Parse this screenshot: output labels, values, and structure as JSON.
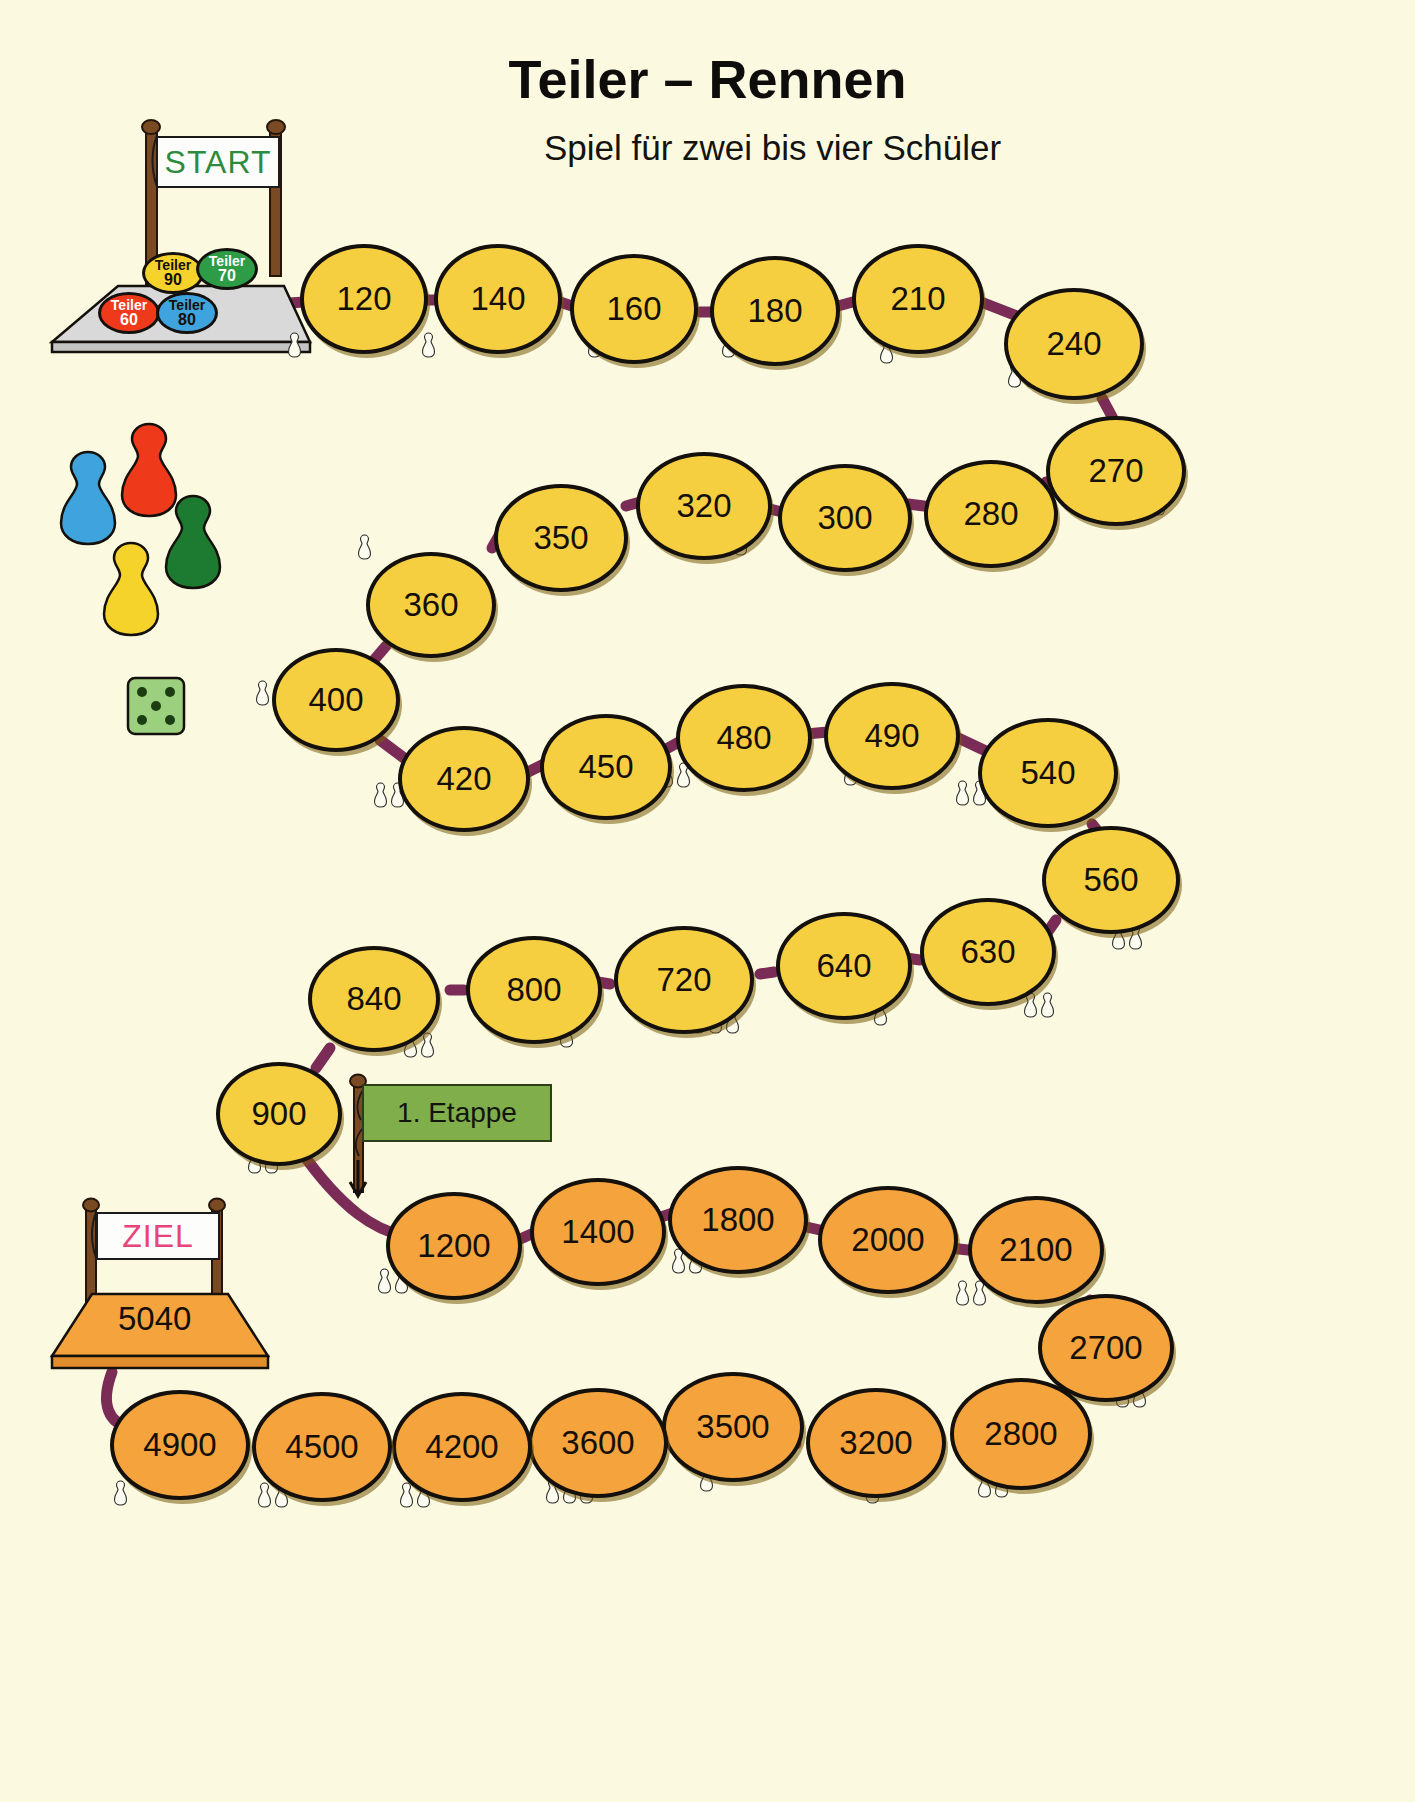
{
  "page": {
    "title": "Teiler – Rennen",
    "subtitle": "Spiel für zwei bis vier Schüler",
    "background_color": "#fbfae0"
  },
  "start_gate": {
    "banner_label": "START",
    "banner_text_color": "#2e8b3d",
    "platform_color": "#d9d9d9"
  },
  "finish_gate": {
    "banner_label": "ZIEL",
    "banner_text_color": "#e8447c",
    "platform_color": "#f5a33c",
    "final_value": "5040"
  },
  "divider_chips": [
    {
      "word": "Teiler",
      "number": "90",
      "color": "#f6d32a",
      "text_color": "#141008"
    },
    {
      "word": "Teiler",
      "number": "70",
      "color": "#2e9b46",
      "text_color": "#ffffff"
    },
    {
      "word": "Teiler",
      "number": "60",
      "color": "#ee3a1b",
      "text_color": "#ffffff"
    },
    {
      "word": "Teiler",
      "number": "80",
      "color": "#3fa3dd",
      "text_color": "#141008"
    }
  ],
  "pawns": [
    {
      "name": "pawn-blue",
      "color": "#3fa3dd"
    },
    {
      "name": "pawn-red",
      "color": "#ee3a1b"
    },
    {
      "name": "pawn-green",
      "color": "#1d7a31"
    },
    {
      "name": "pawn-yellow",
      "color": "#f6d32a"
    }
  ],
  "die": {
    "color": "#9ccf7e",
    "pips": 5,
    "pip_color": "#1c3d12"
  },
  "stage_flag": {
    "label": "1. Etappe",
    "cloth_color": "#7fae4b"
  },
  "colors": {
    "node_stage1": "#f6cf41",
    "node_stage2": "#f5a33c",
    "connector": "#7a2b56",
    "outline": "#14100c"
  },
  "board": {
    "rows": [
      {
        "row": 1,
        "color": "node_stage1",
        "nodes": [
          {
            "value": "120",
            "ticks": 1
          },
          {
            "value": "140",
            "ticks": 1
          },
          {
            "value": "160",
            "ticks": 1
          },
          {
            "value": "180",
            "ticks": 2
          },
          {
            "value": "210",
            "ticks": 1
          },
          {
            "value": "240",
            "ticks": 2
          },
          {
            "value": "270",
            "ticks": 1
          }
        ]
      },
      {
        "row": 2,
        "color": "node_stage1",
        "nodes": [
          {
            "value": "280",
            "ticks": 1
          },
          {
            "value": "300",
            "ticks": 1
          },
          {
            "value": "320",
            "ticks": 1
          },
          {
            "value": "350",
            "ticks": 1
          },
          {
            "value": "360",
            "ticks": 1
          },
          {
            "value": "400",
            "ticks": 1
          }
        ]
      },
      {
        "row": 3,
        "color": "node_stage1",
        "nodes": [
          {
            "value": "420",
            "ticks": 2
          },
          {
            "value": "450",
            "ticks": 1
          },
          {
            "value": "480",
            "ticks": 2
          },
          {
            "value": "490",
            "ticks": 1
          },
          {
            "value": "540",
            "ticks": 2
          },
          {
            "value": "560",
            "ticks": 2
          }
        ]
      },
      {
        "row": 4,
        "color": "node_stage1",
        "nodes": [
          {
            "value": "630",
            "ticks": 2
          },
          {
            "value": "640",
            "ticks": 1
          },
          {
            "value": "720",
            "ticks": 3
          },
          {
            "value": "800",
            "ticks": 1
          },
          {
            "value": "840",
            "ticks": 2
          },
          {
            "value": "900",
            "ticks": 2
          }
        ]
      },
      {
        "row": 5,
        "color": "node_stage2",
        "nodes": [
          {
            "value": "1200",
            "ticks": 2
          },
          {
            "value": "1400",
            "ticks": 1
          },
          {
            "value": "1800",
            "ticks": 2
          },
          {
            "value": "2000",
            "ticks": 1
          },
          {
            "value": "2100",
            "ticks": 2
          },
          {
            "value": "2700",
            "ticks": 2
          }
        ]
      },
      {
        "row": 6,
        "color": "node_stage2",
        "nodes": [
          {
            "value": "2800",
            "ticks": 2
          },
          {
            "value": "3200",
            "ticks": 1
          },
          {
            "value": "3500",
            "ticks": 1
          },
          {
            "value": "3600",
            "ticks": 3
          },
          {
            "value": "4200",
            "ticks": 2
          },
          {
            "value": "4500",
            "ticks": 2
          },
          {
            "value": "4900",
            "ticks": 1
          }
        ]
      }
    ]
  },
  "node_layout": [
    {
      "value": "120",
      "x": 300,
      "y": 244,
      "w": 128,
      "h": 110,
      "color": "y",
      "ticks": 1,
      "tx": 288,
      "ty": 332
    },
    {
      "value": "140",
      "x": 434,
      "y": 244,
      "w": 128,
      "h": 110,
      "color": "y",
      "ticks": 1,
      "tx": 422,
      "ty": 332
    },
    {
      "value": "160",
      "x": 570,
      "y": 254,
      "w": 128,
      "h": 110,
      "color": "y",
      "ticks": 1,
      "tx": 588,
      "ty": 332
    },
    {
      "value": "180",
      "x": 710,
      "y": 256,
      "w": 130,
      "h": 110,
      "color": "y",
      "ticks": 2,
      "tx": 722,
      "ty": 332
    },
    {
      "value": "210",
      "x": 852,
      "y": 244,
      "w": 132,
      "h": 110,
      "color": "y",
      "ticks": 1,
      "tx": 880,
      "ty": 338
    },
    {
      "value": "240",
      "x": 1004,
      "y": 288,
      "w": 140,
      "h": 112,
      "color": "y",
      "ticks": 2,
      "tx": 1008,
      "ty": 362
    },
    {
      "value": "270",
      "x": 1046,
      "y": 416,
      "w": 140,
      "h": 110,
      "color": "y",
      "ticks": 1,
      "tx": 1152,
      "ty": 490
    },
    {
      "value": "280",
      "x": 924,
      "y": 460,
      "w": 134,
      "h": 108,
      "color": "y",
      "ticks": 1,
      "tx": 1020,
      "ty": 532
    },
    {
      "value": "300",
      "x": 778,
      "y": 464,
      "w": 134,
      "h": 108,
      "color": "y",
      "ticks": 1,
      "tx": 876,
      "ty": 534
    },
    {
      "value": "320",
      "x": 636,
      "y": 452,
      "w": 136,
      "h": 108,
      "color": "y",
      "ticks": 1,
      "tx": 734,
      "ty": 530
    },
    {
      "value": "350",
      "x": 494,
      "y": 484,
      "w": 134,
      "h": 108,
      "color": "y",
      "ticks": 1,
      "tx": 596,
      "ty": 542
    },
    {
      "value": "360",
      "x": 366,
      "y": 552,
      "w": 130,
      "h": 106,
      "color": "y",
      "ticks": 1,
      "tx": 358,
      "ty": 534
    },
    {
      "value": "400",
      "x": 272,
      "y": 648,
      "w": 128,
      "h": 104,
      "color": "y",
      "ticks": 1,
      "tx": 256,
      "ty": 680
    },
    {
      "value": "420",
      "x": 398,
      "y": 726,
      "w": 132,
      "h": 106,
      "color": "y",
      "ticks": 2,
      "tx": 374,
      "ty": 782
    },
    {
      "value": "450",
      "x": 540,
      "y": 714,
      "w": 132,
      "h": 106,
      "color": "y",
      "ticks": 1,
      "tx": 586,
      "ty": 786
    },
    {
      "value": "480",
      "x": 676,
      "y": 684,
      "w": 136,
      "h": 108,
      "color": "y",
      "ticks": 2,
      "tx": 660,
      "ty": 762
    },
    {
      "value": "490",
      "x": 824,
      "y": 682,
      "w": 136,
      "h": 108,
      "color": "y",
      "ticks": 1,
      "tx": 844,
      "ty": 760
    },
    {
      "value": "540",
      "x": 978,
      "y": 718,
      "w": 140,
      "h": 110,
      "color": "y",
      "ticks": 2,
      "tx": 956,
      "ty": 780
    },
    {
      "value": "560",
      "x": 1042,
      "y": 826,
      "w": 138,
      "h": 108,
      "color": "y",
      "ticks": 2,
      "tx": 1112,
      "ty": 924
    },
    {
      "value": "630",
      "x": 920,
      "y": 898,
      "w": 136,
      "h": 108,
      "color": "y",
      "ticks": 2,
      "tx": 1024,
      "ty": 992
    },
    {
      "value": "640",
      "x": 776,
      "y": 912,
      "w": 136,
      "h": 108,
      "color": "y",
      "ticks": 1,
      "tx": 874,
      "ty": 1000
    },
    {
      "value": "720",
      "x": 614,
      "y": 926,
      "w": 140,
      "h": 108,
      "color": "y",
      "ticks": 3,
      "tx": 692,
      "ty": 1008
    },
    {
      "value": "800",
      "x": 466,
      "y": 936,
      "w": 136,
      "h": 108,
      "color": "y",
      "ticks": 1,
      "tx": 560,
      "ty": 1022
    },
    {
      "value": "840",
      "x": 308,
      "y": 946,
      "w": 132,
      "h": 106,
      "color": "y",
      "ticks": 2,
      "tx": 404,
      "ty": 1032
    },
    {
      "value": "900",
      "x": 216,
      "y": 1062,
      "w": 126,
      "h": 104,
      "color": "y",
      "ticks": 2,
      "tx": 248,
      "ty": 1148
    },
    {
      "value": "1200",
      "x": 386,
      "y": 1192,
      "w": 136,
      "h": 108,
      "color": "o",
      "ticks": 2,
      "tx": 378,
      "ty": 1268
    },
    {
      "value": "1400",
      "x": 530,
      "y": 1178,
      "w": 136,
      "h": 108,
      "color": "o",
      "ticks": 1,
      "tx": 578,
      "ty": 1258
    },
    {
      "value": "1800",
      "x": 668,
      "y": 1166,
      "w": 140,
      "h": 108,
      "color": "o",
      "ticks": 2,
      "tx": 672,
      "ty": 1248
    },
    {
      "value": "2000",
      "x": 818,
      "y": 1186,
      "w": 140,
      "h": 108,
      "color": "o",
      "ticks": 1,
      "tx": 862,
      "ty": 1266
    },
    {
      "value": "2100",
      "x": 968,
      "y": 1196,
      "w": 136,
      "h": 108,
      "color": "o",
      "ticks": 2,
      "tx": 956,
      "ty": 1280
    },
    {
      "value": "2700",
      "x": 1038,
      "y": 1294,
      "w": 136,
      "h": 108,
      "color": "o",
      "ticks": 2,
      "tx": 1116,
      "ty": 1382
    },
    {
      "value": "2800",
      "x": 950,
      "y": 1378,
      "w": 142,
      "h": 112,
      "color": "o",
      "ticks": 2,
      "tx": 978,
      "ty": 1472
    },
    {
      "value": "3200",
      "x": 806,
      "y": 1388,
      "w": 140,
      "h": 110,
      "color": "o",
      "ticks": 1,
      "tx": 866,
      "ty": 1478
    },
    {
      "value": "3500",
      "x": 662,
      "y": 1372,
      "w": 142,
      "h": 110,
      "color": "o",
      "ticks": 1,
      "tx": 700,
      "ty": 1466
    },
    {
      "value": "3600",
      "x": 528,
      "y": 1388,
      "w": 140,
      "h": 110,
      "color": "o",
      "ticks": 3,
      "tx": 546,
      "ty": 1478
    },
    {
      "value": "4200",
      "x": 392,
      "y": 1392,
      "w": 140,
      "h": 110,
      "color": "o",
      "ticks": 2,
      "tx": 400,
      "ty": 1482
    },
    {
      "value": "4500",
      "x": 252,
      "y": 1392,
      "w": 140,
      "h": 110,
      "color": "o",
      "ticks": 2,
      "tx": 258,
      "ty": 1482
    },
    {
      "value": "4900",
      "x": 110,
      "y": 1390,
      "w": 140,
      "h": 110,
      "color": "o",
      "ticks": 1,
      "tx": 114,
      "ty": 1480
    }
  ]
}
